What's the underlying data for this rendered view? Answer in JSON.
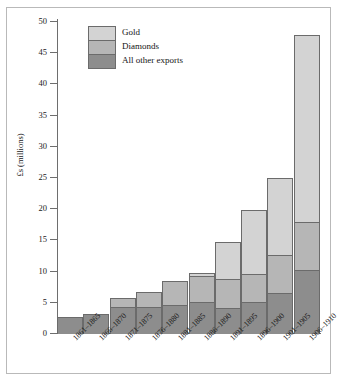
{
  "chart_data": {
    "type": "bar",
    "stacked": true,
    "title": "",
    "xlabel": "",
    "ylabel": "£s (millions)",
    "ylim": [
      0,
      50
    ],
    "yticks": [
      0,
      5,
      10,
      15,
      20,
      25,
      30,
      35,
      40,
      45,
      50
    ],
    "ytick_labels": [
      "0",
      "5",
      "10",
      "15",
      "20",
      "25",
      "30",
      "35",
      "40",
      "45",
      "50"
    ],
    "grid": false,
    "legend_position": "top-left",
    "categories": [
      "1861–1865",
      "1866–1870",
      "1871–1875",
      "1876–1880",
      "1881–1885",
      "1886–1890",
      "1891–1895",
      "1896–1900",
      "1901–1905",
      "1906–1910"
    ],
    "series": [
      {
        "name": "All other exports",
        "color": "#8d8d8d",
        "values": [
          2.7,
          3.2,
          4.4,
          4.4,
          4.7,
          5.2,
          4.1,
          5.2,
          6.6,
          10.2
        ]
      },
      {
        "name": "Diamonds",
        "color": "#b6b6b6",
        "values": [
          0.0,
          0.0,
          1.5,
          2.5,
          3.9,
          4.3,
          4.9,
          4.5,
          6.3,
          7.9
        ]
      },
      {
        "name": "Gold",
        "color": "#d3d3d3",
        "values": [
          0.0,
          0.0,
          0.0,
          0.0,
          0.0,
          0.6,
          6.0,
          10.5,
          12.5,
          30.2
        ]
      }
    ],
    "totals": [
      2.7,
      3.2,
      5.9,
      6.9,
      8.6,
      10.1,
      15.0,
      20.2,
      25.4,
      48.3
    ]
  },
  "legend": {
    "entries": [
      {
        "label": "Gold",
        "key": "gold"
      },
      {
        "label": "Diamonds",
        "key": "diam"
      },
      {
        "label": "All other exports",
        "key": "other"
      }
    ]
  },
  "axis": {
    "y_title": "£s (millions)"
  }
}
